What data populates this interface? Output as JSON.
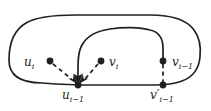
{
  "figure": {
    "type": "graph-diagram",
    "background_color": "#ffffff",
    "stroke_color": "#231f20",
    "nodes": [
      {
        "id": "u_i",
        "label_html": "u<sub>i</sub>",
        "x": 50,
        "y": 61,
        "label_position": "left"
      },
      {
        "id": "v_i",
        "label_html": "v<sub>i</sub>",
        "x": 101,
        "y": 61,
        "label_position": "right"
      },
      {
        "id": "v_i-1",
        "label_html": "v<sub>i−1</sub>",
        "x": 163,
        "y": 61,
        "label_position": "right"
      },
      {
        "id": "u_i-1",
        "label_html": "u<sub>i−1</sub>",
        "x": 78,
        "y": 85,
        "label_position": "below"
      },
      {
        "id": "v'_i-1",
        "label_html": "v′<sub>i−1</sub>",
        "x": 163,
        "y": 85,
        "label_position": "below"
      }
    ],
    "labels": {
      "u_i": {
        "base": "u",
        "prime": "",
        "sub": "i"
      },
      "v_i": {
        "base": "v",
        "prime": "",
        "sub": "i"
      },
      "v_im1": {
        "base": "v",
        "prime": "",
        "sub": "i−1"
      },
      "u_im1": {
        "base": "u",
        "prime": "",
        "sub": "i−1"
      },
      "vp_im1": {
        "base": "v",
        "prime": "′",
        "sub": "i−1"
      }
    },
    "edges": [
      {
        "id": "outer-loop",
        "style": "solid",
        "kind": "closed-rounded-rectangle"
      },
      {
        "id": "inner-arc",
        "style": "solid",
        "kind": "arc-with-arrow",
        "from": "v_i-1",
        "to": "u_i-1"
      },
      {
        "id": "ui-to-uim1",
        "style": "dashed",
        "kind": "arrow",
        "from": "u_i",
        "to": "u_i-1"
      },
      {
        "id": "vi-to-uim1",
        "style": "dashed",
        "kind": "arrow",
        "from": "v_i",
        "to": "u_i-1"
      },
      {
        "id": "vim1-to-vpim1",
        "style": "dashed",
        "kind": "segment",
        "from": "v_i-1",
        "to": "v'_i-1"
      }
    ]
  }
}
